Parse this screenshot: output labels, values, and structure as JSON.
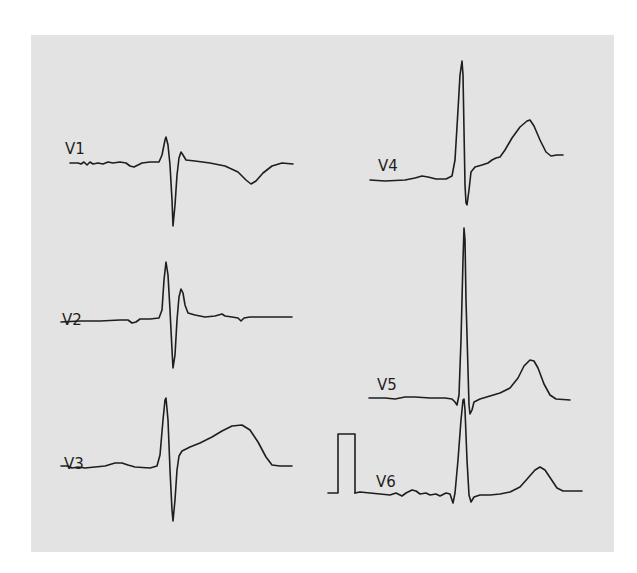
{
  "figure": {
    "title": "",
    "background_color": "#e3e3e3",
    "trace_color": "#1e1e1e"
  },
  "leads": [
    {
      "id": "V1",
      "label": "V1",
      "label_pos": [
        65,
        154
      ]
    },
    {
      "id": "V2",
      "label": "V2",
      "label_pos": [
        62,
        325
      ]
    },
    {
      "id": "V3",
      "label": "V3",
      "label_pos": [
        64,
        469
      ]
    },
    {
      "id": "V4",
      "label": "V4",
      "label_pos": [
        378,
        171
      ]
    },
    {
      "id": "V5",
      "label": "V5",
      "label_pos": [
        377,
        390
      ]
    },
    {
      "id": "V6",
      "label": "V6",
      "label_pos": [
        376,
        547
      ]
    }
  ],
  "calibration": {
    "label": "1 mV calibration pulse",
    "visible": true
  }
}
